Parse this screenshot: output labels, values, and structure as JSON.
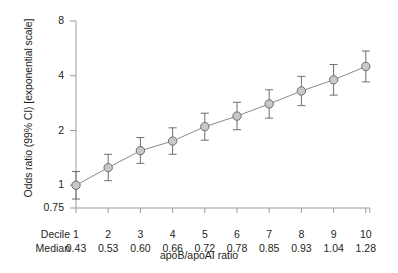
{
  "chart_data": {
    "type": "scatter",
    "title": "",
    "xlabel": "apoB/apoAI ratio",
    "ylabel": "Odds ratio (99% CI) [exponential scale]",
    "yscale": "log",
    "ylim": [
      0.75,
      8
    ],
    "yticks": [
      0.75,
      1,
      2,
      4,
      8
    ],
    "ytick_labels": [
      "0.75",
      "1",
      "2",
      "4",
      "8"
    ],
    "grid": false,
    "legend": null,
    "row_headers": [
      "Decile",
      "Median"
    ],
    "categories": [
      "1",
      "2",
      "3",
      "4",
      "5",
      "6",
      "7",
      "8",
      "9",
      "10"
    ],
    "x": [
      0.43,
      0.53,
      0.6,
      0.66,
      0.72,
      0.78,
      0.85,
      0.93,
      1.04,
      1.28
    ],
    "x_tick_labels": [
      "0.43",
      "0.53",
      "0.60",
      "0.66",
      "0.72",
      "0.78",
      "0.85",
      "0.93",
      "1.04",
      "1.28"
    ],
    "series": [
      {
        "name": "Odds ratio (99% CI)",
        "values": [
          1.0,
          1.25,
          1.55,
          1.75,
          2.1,
          2.4,
          2.8,
          3.3,
          3.8,
          4.5
        ],
        "ci_low": [
          0.84,
          1.06,
          1.32,
          1.48,
          1.77,
          2.02,
          2.34,
          2.74,
          3.13,
          3.7
        ],
        "ci_high": [
          1.19,
          1.48,
          1.83,
          2.07,
          2.49,
          2.86,
          3.35,
          3.97,
          4.61,
          5.47
        ]
      }
    ],
    "annotations": [],
    "marker_fill": "#c8c8c8",
    "marker_stroke": "#6e6e6e",
    "line_color": "#8a8a8a",
    "axis_color": "#9b9b9b"
  }
}
